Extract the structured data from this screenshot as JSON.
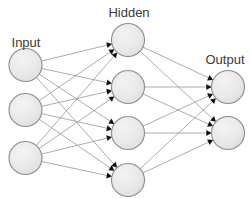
{
  "diagram": {
    "background_color": "#ffffff",
    "node_fill_color": "#e8e8e8",
    "node_stroke_color": "#8d8d8d",
    "edge_color": "#8a8a8a",
    "arrow_color": "#111111",
    "label_color": "#3a3a3a",
    "node_radius": 16.5,
    "labels": {
      "input": "Input",
      "hidden": "Hidden",
      "output": "Output"
    },
    "label_positions": {
      "input": {
        "x": 26,
        "y": 47
      },
      "hidden": {
        "x": 129,
        "y": 17
      },
      "output": {
        "x": 225,
        "y": 64
      }
    },
    "layers": [
      {
        "id": "input",
        "name": "Input",
        "node_count": 3,
        "nodes": [
          {
            "id": "i1",
            "cx": 25.5,
            "cy": 65
          },
          {
            "id": "i2",
            "cx": 25.5,
            "cy": 110
          },
          {
            "id": "i3",
            "cx": 25.5,
            "cy": 158
          }
        ]
      },
      {
        "id": "hidden",
        "name": "Hidden",
        "node_count": 4,
        "nodes": [
          {
            "id": "h1",
            "cx": 128,
            "cy": 40
          },
          {
            "id": "h2",
            "cx": 128,
            "cy": 87
          },
          {
            "id": "h3",
            "cx": 128,
            "cy": 133
          },
          {
            "id": "h4",
            "cx": 128,
            "cy": 180
          }
        ]
      },
      {
        "id": "output",
        "name": "Output",
        "node_count": 2,
        "nodes": [
          {
            "id": "o1",
            "cx": 228,
            "cy": 87
          },
          {
            "id": "o2",
            "cx": 228,
            "cy": 133
          }
        ]
      }
    ],
    "connections": [
      {
        "from": "i1",
        "to": "h1"
      },
      {
        "from": "i1",
        "to": "h2"
      },
      {
        "from": "i1",
        "to": "h3"
      },
      {
        "from": "i1",
        "to": "h4"
      },
      {
        "from": "i2",
        "to": "h1"
      },
      {
        "from": "i2",
        "to": "h2"
      },
      {
        "from": "i2",
        "to": "h3"
      },
      {
        "from": "i2",
        "to": "h4"
      },
      {
        "from": "i3",
        "to": "h1"
      },
      {
        "from": "i3",
        "to": "h2"
      },
      {
        "from": "i3",
        "to": "h3"
      },
      {
        "from": "i3",
        "to": "h4"
      },
      {
        "from": "h1",
        "to": "o1"
      },
      {
        "from": "h1",
        "to": "o2"
      },
      {
        "from": "h2",
        "to": "o1"
      },
      {
        "from": "h2",
        "to": "o2"
      },
      {
        "from": "h3",
        "to": "o1"
      },
      {
        "from": "h3",
        "to": "o2"
      },
      {
        "from": "h4",
        "to": "o1"
      },
      {
        "from": "h4",
        "to": "o2"
      }
    ]
  }
}
